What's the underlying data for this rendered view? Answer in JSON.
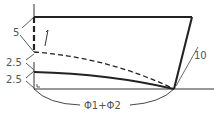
{
  "diagram": {
    "labels": {
      "dim_top": "5",
      "dim_mid": "2.5",
      "dim_low": "2.5",
      "dim_right": "10",
      "angle": "Φ1+Φ2"
    },
    "colors": {
      "line": "#222222",
      "label": "#555555"
    }
  }
}
